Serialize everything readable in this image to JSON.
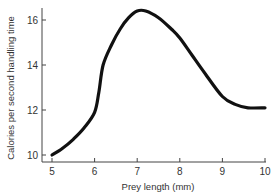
{
  "chart_data": {
    "type": "line",
    "title": "",
    "xlabel": "Prey length (mm)",
    "ylabel": "Calories per second handling time",
    "xlim": [
      5,
      10
    ],
    "ylim": [
      10,
      16
    ],
    "xticks": [
      5,
      6,
      7,
      8,
      9,
      10
    ],
    "yticks": [
      10,
      12,
      14,
      16
    ],
    "grid": false,
    "legend": null,
    "series": [
      {
        "name": "Calories per second handling time",
        "color": "#111111",
        "x": [
          5.0,
          5.25,
          5.5,
          5.75,
          6.0,
          6.1,
          6.2,
          6.4,
          6.6,
          6.8,
          7.0,
          7.2,
          7.5,
          7.8,
          8.0,
          8.3,
          8.6,
          9.0,
          9.3,
          9.6,
          10.0
        ],
        "y": [
          10.0,
          10.3,
          10.7,
          11.2,
          11.9,
          12.8,
          14.0,
          14.9,
          15.6,
          16.1,
          16.4,
          16.4,
          16.1,
          15.6,
          15.2,
          14.4,
          13.6,
          12.6,
          12.25,
          12.1,
          12.1
        ]
      }
    ]
  }
}
